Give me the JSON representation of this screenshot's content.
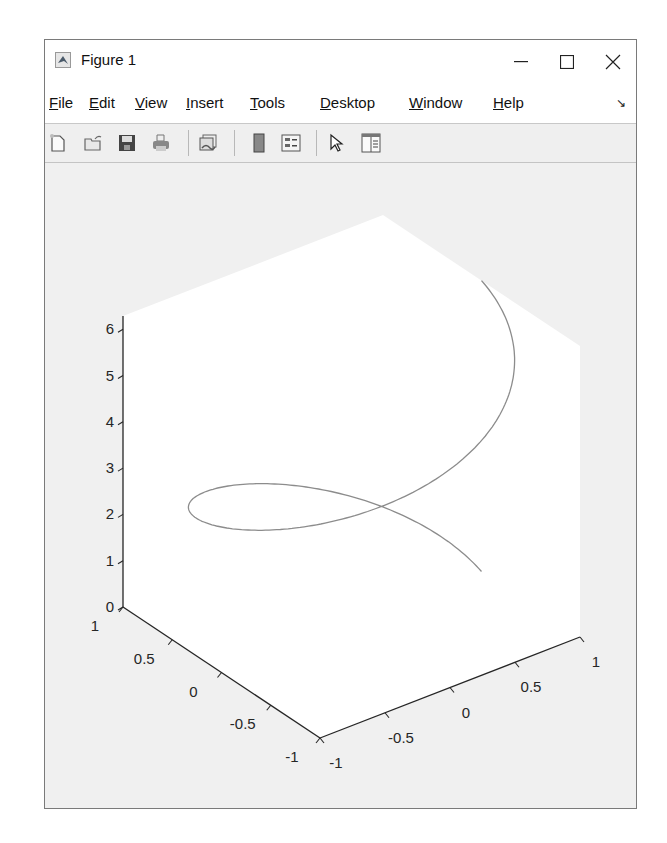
{
  "window": {
    "title": "Figure 1",
    "controls": {
      "minimize": "—",
      "maximize": "☐",
      "close": "✕"
    }
  },
  "menubar": {
    "items": [
      {
        "label": "File",
        "mnemonic": "F",
        "rest": "ile"
      },
      {
        "label": "Edit",
        "mnemonic": "E",
        "rest": "dit"
      },
      {
        "label": "View",
        "mnemonic": "V",
        "rest": "iew"
      },
      {
        "label": "Insert",
        "mnemonic": "I",
        "rest": "nsert"
      },
      {
        "label": "Tools",
        "mnemonic": "T",
        "rest": "ools"
      },
      {
        "label": "Desktop",
        "mnemonic": "D",
        "rest": "esktop"
      },
      {
        "label": "Window",
        "mnemonic": "W",
        "rest": "indow"
      },
      {
        "label": "Help",
        "mnemonic": "H",
        "rest": "elp"
      }
    ],
    "dock_icon": "↘"
  },
  "toolbar": {
    "buttons": [
      {
        "name": "new-figure-icon",
        "tooltip": "New Figure"
      },
      {
        "name": "open-file-icon",
        "tooltip": "Open File"
      },
      {
        "name": "save-figure-icon",
        "tooltip": "Save Figure"
      },
      {
        "name": "print-figure-icon",
        "tooltip": "Print Figure"
      },
      {
        "name": "link-plot-icon",
        "tooltip": "Link Plot"
      },
      {
        "name": "insert-colorbar-icon",
        "tooltip": "Insert Colorbar"
      },
      {
        "name": "insert-legend-icon",
        "tooltip": "Insert Legend"
      },
      {
        "name": "edit-plot-pointer-icon",
        "tooltip": "Edit Plot"
      },
      {
        "name": "property-inspector-icon",
        "tooltip": "Open Property Inspector"
      }
    ]
  },
  "colors": {
    "line": "#8c8c8c",
    "axis": "#262626",
    "axes_bg": "#ffffff",
    "figure_bg": "#f0f0f0"
  },
  "chart_data": {
    "type": "line",
    "plot3d": true,
    "title": "",
    "xlabel": "",
    "ylabel": "",
    "zlabel": "",
    "t_range": [
      0,
      6.2832
    ],
    "xlim": [
      -1,
      1
    ],
    "ylim": [
      -1,
      1
    ],
    "zlim": [
      0,
      6.2832
    ],
    "x_ticks": [
      "-1",
      "-0.5",
      "0",
      "0.5",
      "1"
    ],
    "y_ticks": [
      "-1",
      "-0.5",
      "0",
      "0.5",
      "1"
    ],
    "z_ticks": [
      "0",
      "1",
      "2",
      "3",
      "4",
      "5",
      "6"
    ],
    "grid": false,
    "legend": null,
    "view": "default 3-D (az -37.5, el 30)"
  }
}
